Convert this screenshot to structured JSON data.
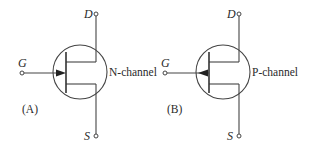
{
  "diagrams": [
    {
      "id": "A",
      "panel_label": "(A)",
      "channel_label": "N-channel",
      "terminals": {
        "drain": "D",
        "gate": "G",
        "source": "S"
      },
      "arrow_direction": "into-channel"
    },
    {
      "id": "B",
      "panel_label": "(B)",
      "channel_label": "P-channel",
      "terminals": {
        "drain": "D",
        "gate": "G",
        "source": "S"
      },
      "arrow_direction": "out-of-channel"
    }
  ],
  "colors": {
    "line": "#444444",
    "text": "#2a2a2a",
    "background": "#ffffff"
  }
}
